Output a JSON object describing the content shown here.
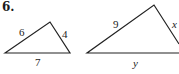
{
  "problem_number": "6.",
  "triangle_1": {
    "sides": {
      "left": "6",
      "right": "4",
      "bottom": "7"
    },
    "vertices": [
      [
        5,
        53
      ],
      [
        50,
        22
      ],
      [
        70,
        53
      ]
    ]
  },
  "triangle_2": {
    "sides": {
      "left": "9",
      "right": "x",
      "bottom": "y"
    },
    "vertices": [
      [
        87,
        53
      ],
      [
        154,
        5
      ],
      [
        179,
        44
      ]
    ]
  },
  "colors": {
    "line": "#222222",
    "background": "#ffffff"
  }
}
